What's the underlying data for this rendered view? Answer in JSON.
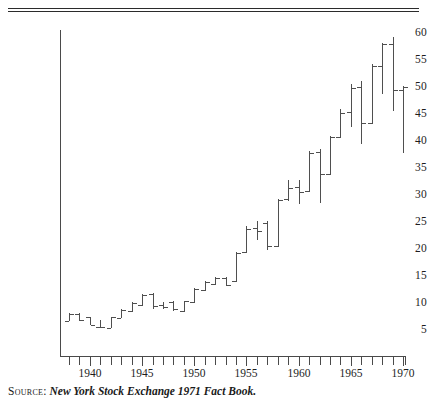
{
  "figure": {
    "source_label": "Source:",
    "source_title": "New York Stock Exchange 1971 Fact Book."
  },
  "chart_data": {
    "type": "ohlc",
    "title": "",
    "xlabel": "",
    "ylabel": "",
    "xlim": [
      1937.5,
      1970.5
    ],
    "ylim": [
      3,
      61
    ],
    "ytick_values": [
      5,
      10,
      15,
      20,
      25,
      30,
      35,
      40,
      45,
      50,
      55,
      60
    ],
    "ytick_labels": [
      "5",
      "10",
      "15",
      "20",
      "25",
      "30",
      "35",
      "40",
      "45",
      "50",
      "55",
      "60"
    ],
    "xtick_values": [
      1938,
      1939,
      1940,
      1941,
      1942,
      1943,
      1944,
      1945,
      1946,
      1947,
      1948,
      1949,
      1950,
      1951,
      1952,
      1953,
      1954,
      1955,
      1956,
      1957,
      1958,
      1959,
      1960,
      1961,
      1962,
      1963,
      1964,
      1965,
      1966,
      1967,
      1968,
      1969,
      1970
    ],
    "xtick_labeled": [
      1940,
      1945,
      1950,
      1955,
      1960,
      1965,
      1970
    ],
    "xtick_labels": [
      "1940",
      "1945",
      "1950",
      "1955",
      "1960",
      "1965",
      "1970"
    ],
    "grid": false,
    "legend": "none",
    "series_name": "NYSE common stock price range",
    "bar_color": "#4f4f4f",
    "axis_color": "#4a4a4a",
    "bars": [
      {
        "x": 1938,
        "low": 6.6,
        "high": 8.2,
        "open": 6.7,
        "close": 8.0
      },
      {
        "x": 1939,
        "low": 6.7,
        "high": 8.1,
        "open": 8.0,
        "close": 6.9
      },
      {
        "x": 1940,
        "low": 5.9,
        "high": 7.5,
        "open": 7.4,
        "close": 6.0
      },
      {
        "x": 1941,
        "low": 5.4,
        "high": 6.9,
        "open": 5.5,
        "close": 5.5
      },
      {
        "x": 1942,
        "low": 5.3,
        "high": 7.5,
        "open": 5.4,
        "close": 7.4
      },
      {
        "x": 1943,
        "low": 7.2,
        "high": 8.9,
        "open": 7.3,
        "close": 8.7
      },
      {
        "x": 1944,
        "low": 8.4,
        "high": 10.1,
        "open": 8.5,
        "close": 10.0
      },
      {
        "x": 1945,
        "low": 9.5,
        "high": 11.6,
        "open": 9.6,
        "close": 11.5
      },
      {
        "x": 1946,
        "low": 8.8,
        "high": 11.8,
        "open": 11.6,
        "close": 9.5
      },
      {
        "x": 1947,
        "low": 8.9,
        "high": 10.2,
        "open": 9.6,
        "close": 9.3
      },
      {
        "x": 1948,
        "low": 8.6,
        "high": 10.3,
        "open": 10.1,
        "close": 8.8
      },
      {
        "x": 1949,
        "low": 8.4,
        "high": 10.4,
        "open": 8.5,
        "close": 10.3
      },
      {
        "x": 1950,
        "low": 10.0,
        "high": 12.8,
        "open": 10.1,
        "close": 12.6
      },
      {
        "x": 1951,
        "low": 12.3,
        "high": 14.1,
        "open": 12.5,
        "close": 13.9
      },
      {
        "x": 1952,
        "low": 13.4,
        "high": 14.9,
        "open": 13.6,
        "close": 14.6
      },
      {
        "x": 1953,
        "low": 13.2,
        "high": 14.9,
        "open": 14.7,
        "close": 13.4
      },
      {
        "x": 1954,
        "low": 13.9,
        "high": 19.4,
        "open": 14.0,
        "close": 19.2
      },
      {
        "x": 1955,
        "low": 19.3,
        "high": 24.2,
        "open": 19.5,
        "close": 23.7
      },
      {
        "x": 1956,
        "low": 21.7,
        "high": 25.2,
        "open": 23.8,
        "close": 23.4
      },
      {
        "x": 1957,
        "low": 19.9,
        "high": 25.1,
        "open": 24.9,
        "close": 20.5
      },
      {
        "x": 1958,
        "low": 20.3,
        "high": 29.3,
        "open": 20.5,
        "close": 29.0
      },
      {
        "x": 1959,
        "low": 28.8,
        "high": 32.8,
        "open": 29.2,
        "close": 31.3
      },
      {
        "x": 1960,
        "low": 28.3,
        "high": 32.7,
        "open": 31.4,
        "close": 30.5
      },
      {
        "x": 1961,
        "low": 30.6,
        "high": 38.1,
        "open": 30.8,
        "close": 37.7
      },
      {
        "x": 1962,
        "low": 28.5,
        "high": 38.6,
        "open": 37.9,
        "close": 33.8
      },
      {
        "x": 1963,
        "low": 33.7,
        "high": 41.0,
        "open": 33.9,
        "close": 40.8
      },
      {
        "x": 1964,
        "low": 40.5,
        "high": 46.0,
        "open": 40.7,
        "close": 45.2
      },
      {
        "x": 1965,
        "low": 42.5,
        "high": 50.5,
        "open": 45.3,
        "close": 49.9
      },
      {
        "x": 1966,
        "low": 39.4,
        "high": 51.1,
        "open": 50.0,
        "close": 43.4
      },
      {
        "x": 1967,
        "low": 43.1,
        "high": 54.2,
        "open": 43.4,
        "close": 53.8
      },
      {
        "x": 1968,
        "low": 48.7,
        "high": 58.1,
        "open": 53.9,
        "close": 58.0
      },
      {
        "x": 1969,
        "low": 45.6,
        "high": 59.3,
        "open": 58.0,
        "close": 49.4
      },
      {
        "x": 1970,
        "low": 37.7,
        "high": 50.2,
        "open": 49.5,
        "close": 50.0
      }
    ]
  }
}
